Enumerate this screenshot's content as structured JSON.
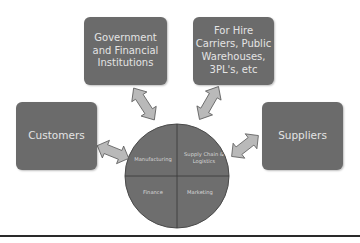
{
  "diagram": {
    "boxes": {
      "government": "Government\nand Financial\nInstitutions",
      "for_hire": "For Hire\nCarriers, Public\nWarehouses,\n3PL's, etc",
      "customers": "Customers",
      "suppliers": "Suppliers"
    },
    "center_circle": {
      "quadrants": {
        "top_left": "Manufacturing",
        "top_right": "Supply Chain &\nLogistics",
        "bottom_left": "Finance",
        "bottom_right": "Marketing"
      }
    },
    "arrows": [
      {
        "from": "Government and Financial Institutions",
        "to": "center",
        "type": "bidirectional"
      },
      {
        "from": "For Hire Carriers, Public Warehouses, 3PL's, etc",
        "to": "center",
        "type": "bidirectional"
      },
      {
        "from": "Customers",
        "to": "center",
        "type": "bidirectional"
      },
      {
        "from": "Suppliers",
        "to": "center",
        "type": "bidirectional"
      }
    ],
    "colors": {
      "box_fill": "#6b6b6b",
      "box_text": "#e4e4e4",
      "circle_fill": "#6e6e6e",
      "arrow_fill": "#b9b9b9",
      "arrow_stroke": "#555555",
      "rule": "#2a2a2a"
    }
  }
}
